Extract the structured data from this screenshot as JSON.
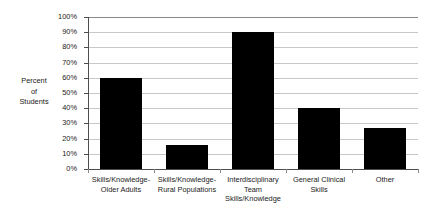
{
  "chart_data": {
    "type": "bar",
    "title": "",
    "xlabel": "",
    "ylabel": "Percent\nof\nStudents",
    "categories": [
      "Skills/Knowledge-\nOlder Adults",
      "Skills/Knowledge-\nRural Populations",
      "Interdisciplinary\nTeam\nSkills/Knowledge",
      "General Clinical\nSkills",
      "Other"
    ],
    "values": [
      60,
      16,
      90,
      40,
      27
    ],
    "value_labels": [
      "60%",
      "16%",
      "90%",
      "40%",
      "27%"
    ],
    "ylim": [
      0,
      100
    ],
    "ytick_values": [
      0,
      10,
      20,
      30,
      40,
      50,
      60,
      70,
      80,
      90,
      100
    ],
    "ytick_labels": [
      "0%",
      "10%",
      "20%",
      "30%",
      "40%",
      "50%",
      "60%",
      "70%",
      "80%",
      "90%",
      "100%"
    ],
    "grid": true,
    "legend": false,
    "bar_color": "#000000",
    "gridline_color": "#c8c8c8",
    "axis_color": "#4d4d4d",
    "background_color": "#ffffff"
  }
}
